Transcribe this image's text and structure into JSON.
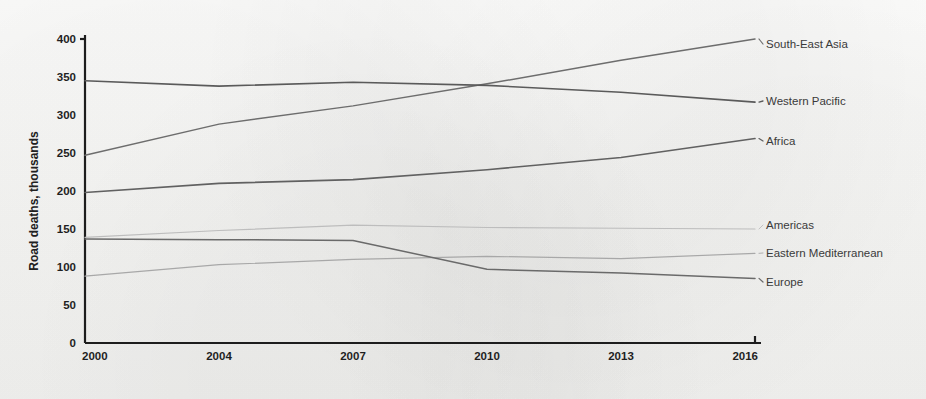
{
  "chart_data": {
    "type": "line",
    "title": "",
    "subtitle": "",
    "xlabel": "",
    "ylabel": "Road deaths, thousands",
    "x": [
      2000,
      2004,
      2007,
      2010,
      2013,
      2016
    ],
    "categories": [
      "2000",
      "2004",
      "2007",
      "2010",
      "2013",
      "2016"
    ],
    "xticklabels": [
      "2000",
      "2004",
      "2007",
      "2010",
      "2013",
      "2016"
    ],
    "yticklabels": [
      "0",
      "50",
      "100",
      "150",
      "200",
      "250",
      "300",
      "350",
      "400"
    ],
    "yticks": [
      0,
      50,
      100,
      150,
      200,
      250,
      300,
      350,
      400
    ],
    "ylim": [
      0,
      400
    ],
    "xlim": [
      2000,
      2016
    ],
    "grid": false,
    "legend_position": "inline-right",
    "series": [
      {
        "name": "South-East Asia",
        "label": "South-East Asia",
        "color": "#6d6d6d",
        "width": 1.5,
        "values": [
          247,
          288,
          312,
          341,
          372,
          400
        ],
        "label_y": 44
      },
      {
        "name": "Western Pacific",
        "label": "Western Pacific",
        "color": "#5a5a5a",
        "width": 1.6,
        "values": [
          345,
          338,
          343,
          339,
          330,
          317
        ],
        "label_y": 101
      },
      {
        "name": "Africa",
        "label": "Africa",
        "color": "#616161",
        "width": 1.6,
        "values": [
          198,
          210,
          215,
          228,
          244,
          269
        ],
        "label_y": 141
      },
      {
        "name": "Americas",
        "label": "Americas",
        "color": "#bdbdbd",
        "width": 1.2,
        "values": [
          139,
          148,
          155,
          152,
          151,
          150
        ],
        "label_y": 225
      },
      {
        "name": "Eastern Mediterranean",
        "label": "Eastern Mediterranean",
        "color": "#a8a8a8",
        "width": 1.2,
        "values": [
          88,
          103,
          110,
          114,
          111,
          118
        ],
        "label_y": 253
      },
      {
        "name": "Europe",
        "label": "Europe",
        "color": "#6a6a6a",
        "width": 1.5,
        "values": [
          137,
          136,
          135,
          97,
          92,
          85
        ],
        "label_y": 282
      }
    ]
  }
}
